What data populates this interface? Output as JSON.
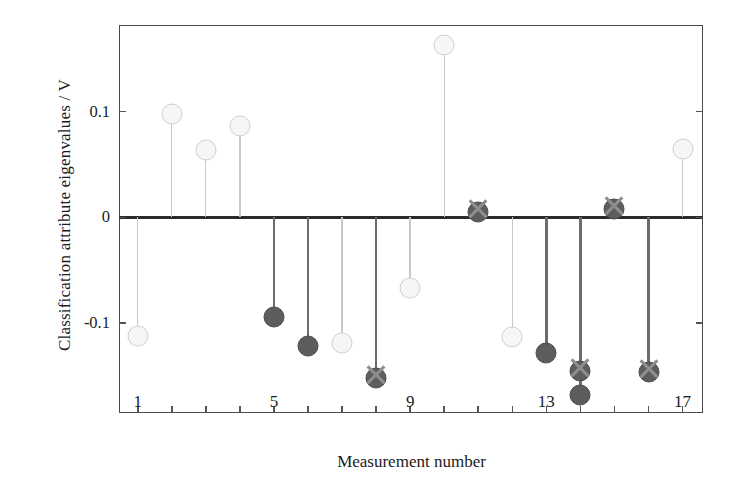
{
  "chart_data": {
    "type": "scatter",
    "title": "",
    "xlabel": "Measurement number",
    "ylabel": "Classification attribute eigenvalues / V",
    "xlim": [
      0.45,
      17.6
    ],
    "ylim": [
      -0.185,
      0.182
    ],
    "grid": false,
    "legend": "none",
    "xticks": [
      1,
      5,
      9,
      13,
      17
    ],
    "xtick_labels": [
      "1",
      "5",
      "9",
      "13",
      "17"
    ],
    "xminor_ticks": [
      2,
      3,
      4,
      6,
      7,
      8,
      10,
      11,
      12,
      14,
      15,
      16
    ],
    "yticks": [
      0.1,
      0,
      -0.1
    ],
    "ytick_labels": [
      "0.1",
      "0",
      "-0.1"
    ],
    "x": [
      1,
      2,
      3,
      4,
      5,
      6,
      7,
      8,
      9,
      10,
      11,
      12,
      13,
      14,
      15,
      16,
      17
    ],
    "values": [
      -0.112,
      0.098,
      0.064,
      0.086,
      -0.094,
      -0.122,
      -0.119,
      -0.152,
      -0.067,
      0.163,
      0.005,
      -0.113,
      -0.128,
      -0.168,
      0.008,
      -0.146,
      0.065
    ],
    "series": [
      {
        "name": "unclassified",
        "marker": "open-circle-light",
        "points": [
          {
            "x": 1,
            "y": -0.112
          },
          {
            "x": 2,
            "y": 0.098
          },
          {
            "x": 3,
            "y": 0.064
          },
          {
            "x": 4,
            "y": 0.086
          },
          {
            "x": 7,
            "y": -0.119
          },
          {
            "x": 9,
            "y": -0.067
          },
          {
            "x": 10,
            "y": 0.163
          },
          {
            "x": 12,
            "y": -0.113
          },
          {
            "x": 17,
            "y": 0.065
          }
        ]
      },
      {
        "name": "classified",
        "marker": "filled-circle-dark-with-x",
        "points": [
          {
            "x": 5,
            "y": -0.094
          },
          {
            "x": 6,
            "y": -0.122
          },
          {
            "x": 8,
            "y": -0.152
          },
          {
            "x": 11,
            "y": 0.005
          },
          {
            "x": 13,
            "y": -0.128
          },
          {
            "x": 14,
            "y": -0.168
          },
          {
            "x": 14,
            "y": -0.145
          },
          {
            "x": 15,
            "y": 0.008
          },
          {
            "x": 16,
            "y": -0.146
          }
        ]
      }
    ],
    "x_cross_overlays": [
      8,
      11,
      14,
      15,
      16
    ],
    "colors": {
      "light_marker_fill": "#f6f6f6",
      "light_marker_edge": "#cfcfcf",
      "dark_marker_fill": "#5d5d5d",
      "dark_marker_edge": "#4c4c4c",
      "light_stem": "#c9c9c9",
      "dark_stem": "#6c6c6c",
      "axis": "#4a4a4a",
      "zero_line": "#2b2b2b",
      "text": "#1b1b1b",
      "background": "#ffffff"
    }
  }
}
